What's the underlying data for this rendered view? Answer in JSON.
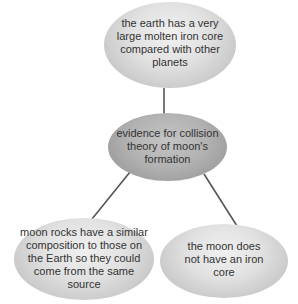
{
  "diagram": {
    "type": "concept-map",
    "colors": {
      "connector": "#555555",
      "text": "#333333",
      "light_node_center": "#f0f0f0",
      "light_node_edge": "#b9b9b9",
      "dark_node_center": "#c4c4c4",
      "dark_node_edge": "#8c8c8c"
    },
    "nodes": {
      "top": {
        "text": "the earth has a very large molten iron core compared with other planets"
      },
      "center": {
        "text": "evidence for collision theory of moon's formation"
      },
      "left": {
        "text": "moon rocks have a similar composition to those on the Earth so they could come from the same source"
      },
      "right": {
        "text": "the moon does not have an iron core"
      }
    },
    "edges": [
      {
        "from": "center",
        "to": "top"
      },
      {
        "from": "center",
        "to": "left"
      },
      {
        "from": "center",
        "to": "right"
      }
    ]
  }
}
